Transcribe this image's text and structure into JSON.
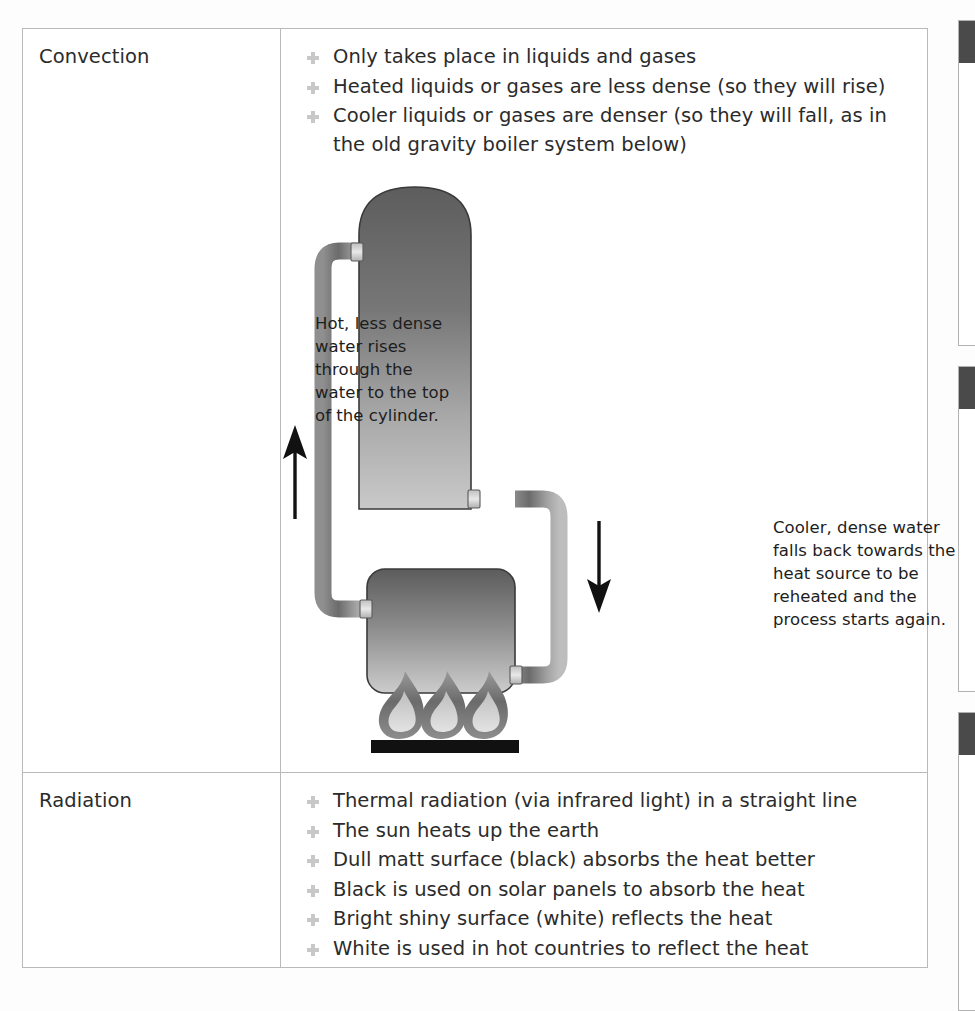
{
  "document": {
    "title": "Methods of Heat Transfer",
    "bullet_icon": "plus-bullet-icon"
  },
  "table": {
    "rows": [
      {
        "label": "Convection",
        "bullets": [
          "Only takes place in liquids and gases",
          "Heated liquids or gases are less dense (so they will rise)",
          "Cooler liquids or gases are denser (so they will fall, as in the old gravity boiler system below)"
        ],
        "diagram": {
          "name": "gravity-boiler-convection-diagram",
          "annotation_left": "Hot, less dense water rises through the water to the top of the cylinder.",
          "annotation_right": "Cooler, dense water falls back towards the heat source to be reheated and the process starts again.",
          "arrow_up_label": "up-arrow",
          "arrow_down_label": "down-arrow",
          "parts": [
            "hot-water-cylinder",
            "boiler",
            "flow-pipe",
            "return-pipe",
            "flames",
            "burner-bar"
          ],
          "flame_count": 3
        }
      },
      {
        "label": "Radiation",
        "bullets": [
          "Thermal radiation (via infrared light) in a straight line",
          "The sun heats up the earth",
          "Dull matt surface (black) absorbs the heat better",
          "Black is used on solar panels to absorb the heat",
          "Bright shiny surface (white) reflects the heat",
          "White is used in hot countries to reflect the heat"
        ]
      }
    ]
  },
  "edge_boxes": [
    {
      "name": "edge-panel-1"
    },
    {
      "name": "edge-panel-2"
    },
    {
      "name": "edge-panel-3"
    }
  ],
  "colors": {
    "text": "#2b2b2b",
    "border": "#b9b9b9",
    "bullet": "#c8c8c8",
    "metal_dark": "#6e6e6e",
    "metal_light": "#cfcfcf",
    "flame_outer": "#6f6f6f",
    "flame_inner": "#d5d5d5",
    "burner": "#111111"
  }
}
